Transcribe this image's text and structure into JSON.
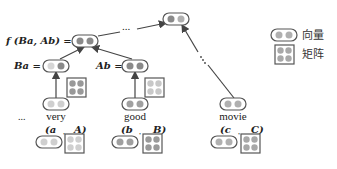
{
  "diagram": {
    "type": "recursive-matrix-vector-composition-tree",
    "colors": {
      "outline": "#555555",
      "circle_dark": "#8a8a8a",
      "circle_mid": "#a8a8a8",
      "circle_light": "#cfcfcf",
      "arrow": "#444444",
      "text": "#222222"
    },
    "nodes": {
      "top": {
        "label": ""
      },
      "top_ellipsis": "...",
      "composed": {
        "label": "f (Ba, Ab) ="
      },
      "ba": {
        "label": "Ba ="
      },
      "ab": {
        "label": "Ab ="
      },
      "side_ellipsis": "..."
    },
    "words": [
      {
        "word": "very",
        "vector_symbol": "(a",
        "matrix_symbol": "A)"
      },
      {
        "word": "good",
        "vector_symbol": "(b",
        "matrix_symbol": "B)"
      },
      {
        "word": "movie",
        "vector_symbol": "(c",
        "matrix_symbol": "C)"
      }
    ],
    "leading_ellipsis": "...",
    "separator": ","
  },
  "legend": {
    "items": [
      {
        "shape": "vector",
        "label": "向量"
      },
      {
        "shape": "matrix",
        "label": "矩阵"
      }
    ]
  }
}
